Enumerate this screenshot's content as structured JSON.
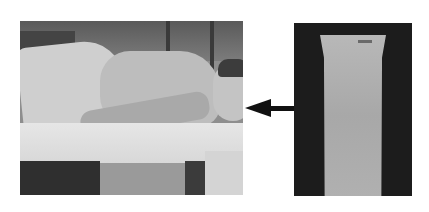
{
  "figure": {
    "left_photo": {
      "description": "patient lying on side on bed with pad underneath",
      "colors": {
        "background": "#8e8e8e",
        "pad": "#e0e0e0",
        "dark": "#2f2f2f"
      }
    },
    "arrow": {
      "direction": "left",
      "color": "#111111"
    },
    "right_photo": {
      "description": "long rectangular pad/cushion on dark background",
      "colors": {
        "background": "#1c1c1c",
        "cushion": "#b0b0b0"
      }
    }
  }
}
